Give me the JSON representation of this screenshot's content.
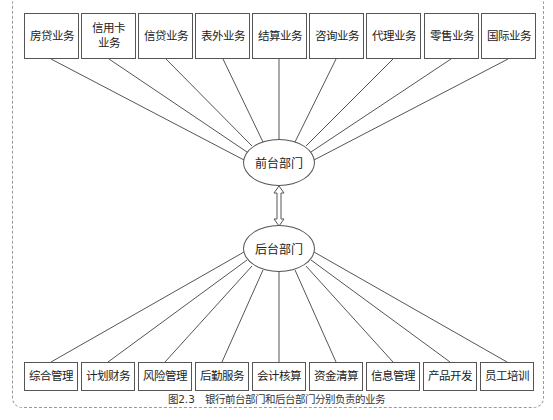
{
  "diagram": {
    "front_department": {
      "label": "前台部门"
    },
    "back_department": {
      "label": "后台部门"
    },
    "front_businesses": [
      {
        "label": "房贷业务"
      },
      {
        "label": "信用卡业务"
      },
      {
        "label": "信贷业务"
      },
      {
        "label": "表外业务"
      },
      {
        "label": "结算业务"
      },
      {
        "label": "咨询业务"
      },
      {
        "label": "代理业务"
      },
      {
        "label": "零售业务"
      },
      {
        "label": "国际业务"
      }
    ],
    "back_businesses": [
      {
        "label": "综合管理"
      },
      {
        "label": "计划财务"
      },
      {
        "label": "风险管理"
      },
      {
        "label": "后勤服务"
      },
      {
        "label": "会计核算"
      },
      {
        "label": "资金清算"
      },
      {
        "label": "信息管理"
      },
      {
        "label": "产品开发"
      },
      {
        "label": "员工培训"
      }
    ],
    "connector": "double-arrow"
  },
  "caption": {
    "number": "图2.3",
    "text": "银行前台部门和后台部门分别负责的业务"
  },
  "colors": {
    "line": "#555555",
    "frame": "#9a9a9a",
    "background": "#ffffff"
  }
}
